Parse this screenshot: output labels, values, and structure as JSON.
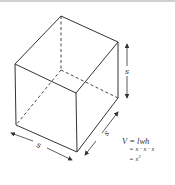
{
  "diagram": {
    "shape": "cube",
    "labels": {
      "height": "s",
      "depth": "s",
      "width": "s"
    },
    "formula": {
      "line1": "V = lwh",
      "line2": "= s · s · s",
      "line3_base": "= s",
      "line3_exp": "3"
    },
    "colors": {
      "stroke": "#333333",
      "background": "#ffffff"
    }
  }
}
